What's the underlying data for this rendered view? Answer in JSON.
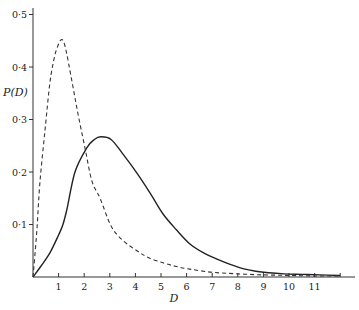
{
  "chart_data": {
    "type": "line",
    "title": "",
    "xlabel": "D",
    "ylabel": "P(D)",
    "xlim": [
      0,
      12.2
    ],
    "ylim": [
      0,
      0.5
    ],
    "grid": false,
    "legend": "none",
    "x_ticks": [
      1,
      2,
      3,
      4,
      5,
      6,
      7,
      8,
      9,
      10,
      11,
      12
    ],
    "x_tick_labels": [
      "1",
      "2",
      "3",
      "4",
      "5",
      "6",
      "7",
      "8",
      "9",
      "10",
      "11",
      ""
    ],
    "y_ticks": [
      0.1,
      0.2,
      0.3,
      0.4,
      0.5
    ],
    "y_tick_labels": [
      "0·1",
      "0·2",
      "0·3",
      "0·4",
      "0·5"
    ],
    "series": [
      {
        "name": "solid",
        "style": "solid",
        "x": [
          0,
          0.3,
          0.66,
          1.0,
          1.17,
          1.33,
          1.64,
          2.1,
          2.4,
          2.65,
          3.05,
          3.5,
          4.06,
          4.6,
          5.08,
          5.6,
          6.13,
          6.7,
          7.19,
          7.7,
          8.2,
          8.7,
          9.2,
          9.8,
          10.5,
          11.2,
          12.0
        ],
        "y": [
          0,
          0.02,
          0.046,
          0.08,
          0.1,
          0.13,
          0.2,
          0.246,
          0.262,
          0.267,
          0.262,
          0.235,
          0.198,
          0.158,
          0.12,
          0.09,
          0.063,
          0.045,
          0.034,
          0.024,
          0.016,
          0.011,
          0.008,
          0.006,
          0.005,
          0.004,
          0.003
        ]
      },
      {
        "name": "dashed",
        "style": "dashed",
        "x": [
          0,
          0.15,
          0.27,
          0.47,
          0.66,
          0.82,
          0.94,
          1.1,
          1.25,
          1.52,
          1.76,
          2.03,
          2.3,
          2.62,
          3.05,
          3.5,
          4.06,
          4.5,
          5.08,
          5.6,
          6.13,
          7.0,
          8.0,
          9.0,
          10.0,
          11.0,
          12.0
        ],
        "y": [
          0,
          0.088,
          0.18,
          0.28,
          0.37,
          0.415,
          0.436,
          0.452,
          0.44,
          0.373,
          0.31,
          0.246,
          0.183,
          0.15,
          0.097,
          0.07,
          0.05,
          0.037,
          0.027,
          0.02,
          0.015,
          0.009,
          0.006,
          0.004,
          0.003,
          0.002,
          0.002
        ]
      }
    ]
  }
}
